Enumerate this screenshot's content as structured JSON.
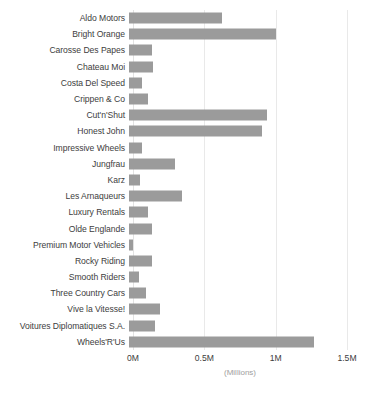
{
  "chart_data": {
    "type": "bar",
    "orientation": "horizontal",
    "title": "",
    "xlabel": "(Millions)",
    "ylabel": "",
    "xlim": [
      0,
      1500000
    ],
    "grid": true,
    "legend": "none",
    "bar_color": "#9b9b9b",
    "label_color": "#3d3d3d",
    "axis_title_color": "#9e9e9e",
    "tick_labels": [
      "0M",
      "0.5M",
      "1M",
      "1.5M"
    ],
    "tick_values": [
      0,
      500000,
      1000000,
      1500000
    ],
    "categories": [
      "Aldo Motors",
      "Bright Orange",
      "Carosse Des Papes",
      "Chateau Moi",
      "Costa Del Speed",
      "Crippen & Co",
      "Cut'n'Shut",
      "Honest John",
      "Impressive Wheels",
      "Jungfrau",
      "Karz",
      "Les Arnaqueurs",
      "Luxury Rentals",
      "Olde Englande",
      "Premium Motor Vehicles",
      "Rocky Riding",
      "Smooth Riders",
      "Three Country Cars",
      "Vive la Vitesse!",
      "Voitures Diplomatiques S.A.",
      "Wheels'R'Us"
    ],
    "values": [
      650000,
      1030000,
      160000,
      170000,
      90000,
      130000,
      970000,
      935000,
      90000,
      320000,
      80000,
      370000,
      130000,
      160000,
      30000,
      160000,
      70000,
      120000,
      220000,
      180000,
      1300000
    ]
  }
}
